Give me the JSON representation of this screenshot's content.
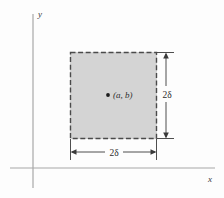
{
  "figure": {
    "background_color": "#fdfdfd"
  },
  "axes": {
    "x_label": "x",
    "y_label": "y",
    "axis_color": "#a8a8a8",
    "x_axis": {
      "y": 168,
      "x_start": 10,
      "x_end": 215
    },
    "y_axis": {
      "x": 33,
      "y_start": 14,
      "y_end": 188
    }
  },
  "region": {
    "name": "shaded-square",
    "fill_color": "#d4d4d4",
    "border_color": "#4a4a4a",
    "border_style": "dashed",
    "left": 70,
    "top": 52,
    "right": 157,
    "bottom": 139
  },
  "center_point": {
    "label": "(a, b)",
    "marker_color": "#1c1c1c",
    "x": 108,
    "y": 95
  },
  "dimensions": [
    {
      "name": "vertical-dimension",
      "label": "2δ",
      "orientation": "vertical",
      "line_x": 166,
      "top": 52,
      "bottom": 139
    },
    {
      "name": "horizontal-dimension",
      "label": "2δ",
      "orientation": "horizontal",
      "line_y": 152,
      "left": 70,
      "right": 157
    }
  ],
  "colors": {
    "fill": "#d4d4d4",
    "dash": "#4a4a4a",
    "axis": "#a8a8a8",
    "dimension": "#3a3a3a",
    "text": "#2e2e2e"
  }
}
